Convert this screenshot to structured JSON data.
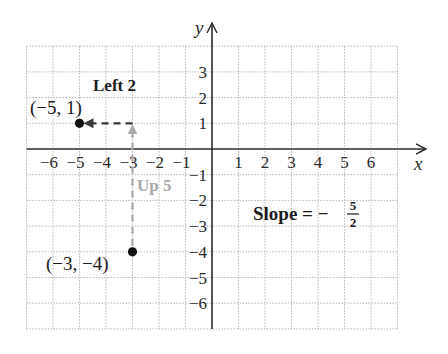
{
  "diagram": {
    "type": "coordinate-plane-slope",
    "axes": {
      "x_label": "x",
      "y_label": "y",
      "x_ticks": [
        "−6",
        "−5",
        "−4",
        "−3",
        "−2",
        "−1",
        "1",
        "2",
        "3",
        "4",
        "5",
        "6"
      ],
      "x_tick_values": [
        -6,
        -5,
        -4,
        -3,
        -2,
        -1,
        1,
        2,
        3,
        4,
        5,
        6
      ],
      "y_ticks": [
        "3",
        "2",
        "1",
        "−1",
        "−2",
        "−3",
        "−4",
        "−5",
        "−6"
      ],
      "y_tick_values": [
        3,
        2,
        1,
        -1,
        -2,
        -3,
        -4,
        -5,
        -6
      ],
      "grid_x_range": [
        -7,
        7
      ],
      "grid_y_range": [
        -7,
        4
      ]
    },
    "points": [
      {
        "label": "(−5, 1)",
        "x": -5,
        "y": 1
      },
      {
        "label": "(−3, −4)",
        "x": -3,
        "y": -4
      }
    ],
    "moves": [
      {
        "label": "Up 5",
        "from": [
          -3,
          -4
        ],
        "to": [
          -3,
          1
        ],
        "color": "#a9a9a9"
      },
      {
        "label": "Left 2",
        "from": [
          -3,
          1
        ],
        "to": [
          -5,
          1
        ],
        "color": "#3a3a3a"
      }
    ],
    "slope": {
      "prefix": "Slope = −",
      "numerator": "5",
      "denominator": "2"
    },
    "colors": {
      "grid": "#b8b8b8",
      "axis": "#2a2a2a",
      "up_arrow": "#a9a9a9",
      "left_arrow": "#3a3a3a",
      "point": "#111111"
    }
  }
}
